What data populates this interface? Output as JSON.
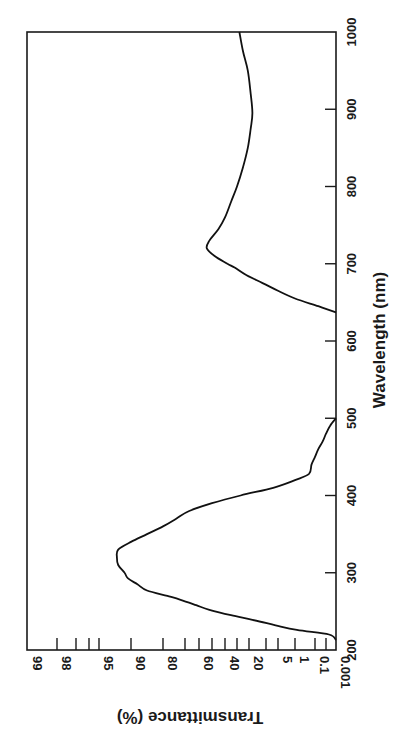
{
  "chart_data": {
    "type": "line",
    "title": "",
    "orientation": "rotated 90° counter-clockwise (wavelength axis runs vertically on the right, transmittance axis runs horizontally along the bottom)",
    "xlabel": "Wavelength (nm)",
    "ylabel": "Transmittance (%)",
    "xlim": [
      200,
      1000
    ],
    "ylim": [
      0.001,
      99
    ],
    "y_scale": "probability (normal-quantile) scale",
    "x_ticks": [
      200,
      300,
      400,
      500,
      600,
      700,
      800,
      900,
      1000
    ],
    "y_ticks": [
      {
        "value": 99,
        "label": "99"
      },
      {
        "value": 98,
        "label": "98"
      },
      {
        "value": 97,
        "label": ""
      },
      {
        "value": 96,
        "label": ""
      },
      {
        "value": 95,
        "label": "95"
      },
      {
        "value": 90,
        "label": "90"
      },
      {
        "value": 80,
        "label": "80"
      },
      {
        "value": 70,
        "label": ""
      },
      {
        "value": 60,
        "label": "60"
      },
      {
        "value": 50,
        "label": ""
      },
      {
        "value": 40,
        "label": "40"
      },
      {
        "value": 30,
        "label": ""
      },
      {
        "value": 20,
        "label": "20"
      },
      {
        "value": 10,
        "label": ""
      },
      {
        "value": 5,
        "label": "5"
      },
      {
        "value": 1,
        "label": "1"
      },
      {
        "value": 0.1,
        "label": "0.1"
      },
      {
        "value": 0.01,
        "label": ""
      },
      {
        "value": 0.001,
        "label": "0.001"
      }
    ],
    "grid": false,
    "legend": null,
    "series": [
      {
        "name": "Transmittance",
        "color": "#111111",
        "segments": [
          {
            "x": [
              213,
              220,
              226,
              232,
              239,
              245,
              252,
              258,
              265,
              270,
              277,
              285,
              293,
              300,
              310,
              320,
              330,
              340,
              350,
              360,
              370,
              380,
              390,
              400,
              410,
              420,
              428,
              440,
              450,
              460,
              470,
              480,
              490,
              500
            ],
            "y": [
              0.001,
              0.005,
              0.8,
              6,
              18,
              35,
              52,
              62,
              72,
              78,
              85,
              88,
              90.5,
              91,
              92,
              92.2,
              92,
              90,
              85,
              80,
              74,
              67,
              50,
              27,
              7,
              1,
              0.2,
              0.15,
              0.1,
              0.05,
              0.02,
              0.01,
              0.004,
              0.001
            ]
          },
          {
            "x": [
              637,
              645,
              655,
              665,
              675,
              685,
              695,
              700,
              710,
              720,
              730,
              745,
              760,
              780,
              800,
              825,
              850,
              875,
              895,
              920,
              950,
              975,
              1000
            ],
            "y": [
              0.001,
              0.05,
              1,
              5,
              12,
              22,
              32,
              38,
              48,
              54,
              52,
              45,
              40,
              35,
              30,
              25,
              21,
              19,
              18,
              19,
              21,
              25,
              28
            ]
          }
        ]
      }
    ]
  }
}
